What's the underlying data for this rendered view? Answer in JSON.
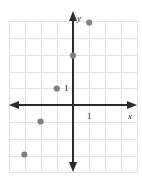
{
  "figure": {
    "background_color": "#ffffff",
    "grid_color": "#e2e2e2",
    "axis_color": "#2b2b2b",
    "point_color": "#808080"
  },
  "chart_data": {
    "type": "scatter",
    "title": "",
    "xlabel": "x",
    "ylabel": "y",
    "grid": true,
    "legend": false,
    "xlim": [
      -4,
      4
    ],
    "ylim": [
      -5,
      5
    ],
    "x_tick_labels": [
      "1"
    ],
    "y_tick_labels": [
      "1"
    ],
    "x_ticks": [
      1
    ],
    "y_ticks": [
      1
    ],
    "points": [
      {
        "label": "point-1",
        "x": 1,
        "y": 5
      },
      {
        "label": "point-2",
        "x": 0,
        "y": 3
      },
      {
        "label": "point-3",
        "x": -1,
        "y": 1
      },
      {
        "label": "point-4",
        "x": -2,
        "y": -1
      },
      {
        "label": "point-5",
        "x": -3,
        "y": -3
      }
    ]
  },
  "labels": {
    "x_axis": "x",
    "y_axis": "y",
    "x_unit": "1",
    "y_unit": "1"
  }
}
